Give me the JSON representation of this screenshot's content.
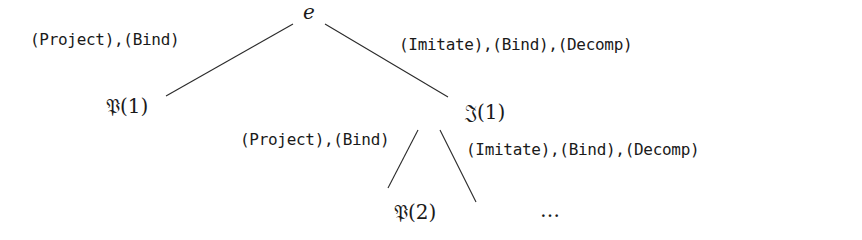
{
  "diagram": {
    "type": "derivation-tree",
    "root": {
      "label": "e"
    },
    "nodes": {
      "p1": {
        "label": "𝔓(1)"
      },
      "i1": {
        "label": "𝔍(1)"
      },
      "p2": {
        "label": "𝔓(2)"
      },
      "ellipsis": {
        "label": "…"
      }
    },
    "edges": [
      {
        "from": "e",
        "to": "𝔓(1)",
        "label": "(Project),(Bind)"
      },
      {
        "from": "e",
        "to": "𝔍(1)",
        "label": "(Imitate),(Bind),(Decomp)"
      },
      {
        "from": "𝔍(1)",
        "to": "𝔓(2)",
        "label": "(Project),(Bind)"
      },
      {
        "from": "𝔍(1)",
        "to": "…",
        "label": "(Imitate),(Bind),(Decomp)"
      }
    ]
  }
}
